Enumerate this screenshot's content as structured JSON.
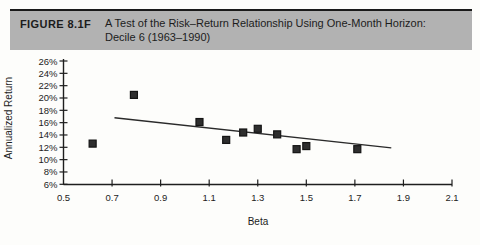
{
  "figure": {
    "label": "FIGURE 8.1F",
    "title_line1": "A Test of the Risk–Return Relationship Using One-Month Horizon:",
    "title_line2": "Decile 6 (1963–1990)"
  },
  "colors": {
    "header_bg": "#b2b2b2",
    "header_rule": "#1a1a1a",
    "page_bg": "#fdfdfb",
    "ink": "#1e1e1e",
    "marker_fill": "#2e2e2e",
    "marker_edge": "#141414",
    "trend_line": "#2a2a2a"
  },
  "chart_data": {
    "type": "scatter",
    "title": "",
    "xlabel": "Beta",
    "ylabel": "Annualized Return",
    "xlim": [
      0.5,
      2.1
    ],
    "ylim": [
      6,
      26
    ],
    "x_ticks": [
      0.5,
      0.7,
      0.9,
      1.1,
      1.3,
      1.5,
      1.7,
      1.9,
      2.1
    ],
    "y_ticks": [
      26,
      24,
      22,
      20,
      18,
      16,
      14,
      12,
      10,
      8,
      6
    ],
    "y_tick_suffix": "%",
    "grid": false,
    "legend": "none",
    "marker": "square",
    "points": [
      {
        "beta": 0.62,
        "return_pct": 12.6
      },
      {
        "beta": 0.79,
        "return_pct": 20.5
      },
      {
        "beta": 1.06,
        "return_pct": 16.1
      },
      {
        "beta": 1.17,
        "return_pct": 13.2
      },
      {
        "beta": 1.24,
        "return_pct": 14.4
      },
      {
        "beta": 1.3,
        "return_pct": 15.0
      },
      {
        "beta": 1.38,
        "return_pct": 14.1
      },
      {
        "beta": 1.46,
        "return_pct": 11.7
      },
      {
        "beta": 1.5,
        "return_pct": 12.2
      },
      {
        "beta": 1.71,
        "return_pct": 11.7
      }
    ],
    "trend_line": {
      "x1": 0.71,
      "y1": 16.8,
      "x2": 1.85,
      "y2": 11.9
    }
  }
}
